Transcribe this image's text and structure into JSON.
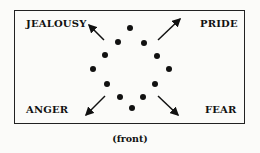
{
  "diagram": {
    "labels": {
      "top_left": "JEALOUSY",
      "top_right": "PRIDE",
      "bottom_left": "ANGER",
      "bottom_right": "FEAR"
    },
    "caption": "(front)",
    "dots": [
      {
        "x": 130,
        "y": 28
      },
      {
        "x": 118,
        "y": 42
      },
      {
        "x": 144,
        "y": 43
      },
      {
        "x": 105,
        "y": 55
      },
      {
        "x": 157,
        "y": 56
      },
      {
        "x": 93,
        "y": 69
      },
      {
        "x": 169,
        "y": 69
      },
      {
        "x": 107,
        "y": 84
      },
      {
        "x": 155,
        "y": 84
      },
      {
        "x": 120,
        "y": 97
      },
      {
        "x": 143,
        "y": 97
      },
      {
        "x": 132,
        "y": 108
      }
    ],
    "arrows": [
      {
        "name": "arrow-to-jealousy",
        "from": [
          104,
          40
        ],
        "to": [
          88,
          24
        ]
      },
      {
        "name": "arrow-to-pride",
        "from": [
          158,
          40
        ],
        "to": [
          180,
          19
        ]
      },
      {
        "name": "arrow-to-anger",
        "from": [
          105,
          96
        ],
        "to": [
          85,
          116
        ]
      },
      {
        "name": "arrow-to-fear",
        "from": [
          158,
          96
        ],
        "to": [
          178,
          115
        ]
      }
    ]
  }
}
